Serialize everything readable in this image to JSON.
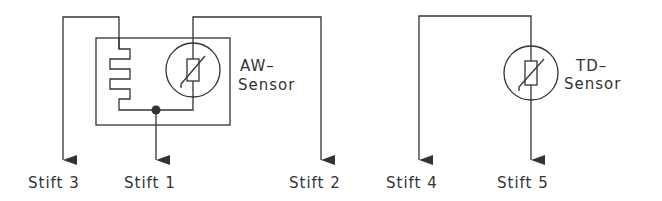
{
  "diagram": {
    "colors": {
      "line": "#333333",
      "background": "#ffffff"
    },
    "sensors": [
      {
        "id": "aw",
        "label_line1": "AW–",
        "label_line2": "Sensor"
      },
      {
        "id": "td",
        "label_line1": "TD–",
        "label_line2": "Sensor"
      }
    ],
    "pins": [
      {
        "id": "stift3",
        "label": "Stift 3"
      },
      {
        "id": "stift1",
        "label": "Stift 1"
      },
      {
        "id": "stift2",
        "label": "Stift 2"
      },
      {
        "id": "stift4",
        "label": "Stift 4"
      },
      {
        "id": "stift5",
        "label": "Stift 5"
      }
    ]
  }
}
